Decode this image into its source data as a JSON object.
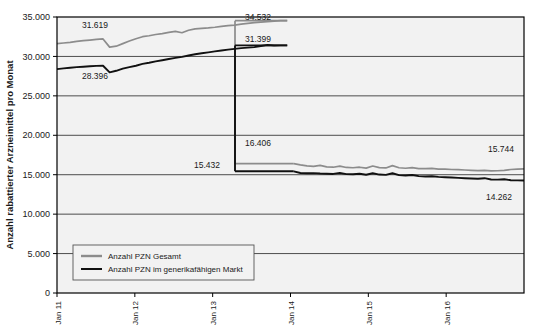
{
  "chart_data": {
    "type": "line",
    "title": "",
    "xlabel": "",
    "ylabel": "Anzahl rabattierter Arzneimittel pro Monat",
    "ylim": [
      0,
      35000
    ],
    "yticks": [
      "0",
      "5.000",
      "10.000",
      "15.000",
      "20.000",
      "25.000",
      "30.000",
      "35.000"
    ],
    "ytick_values": [
      0,
      5000,
      10000,
      15000,
      20000,
      25000,
      30000,
      35000
    ],
    "xticks": [
      "Jan 11",
      "Jan 12",
      "Jan 13",
      "Jan 14",
      "Jan 15",
      "Jan 16"
    ],
    "xtick_values": [
      0,
      12,
      24,
      36,
      48,
      60
    ],
    "xlim": [
      0,
      72
    ],
    "grid": "horizontal",
    "legend_position": "bottom-left",
    "series": [
      {
        "name": "Anzahl PZN Gesamt",
        "color": "#8c8c8c",
        "values": [
          31619,
          31700,
          31780,
          31900,
          32000,
          32080,
          32150,
          32220,
          31180,
          31300,
          31620,
          31950,
          32250,
          32500,
          32620,
          32780,
          32900,
          33050,
          33180,
          33000,
          33320,
          33500,
          33560,
          33620,
          33700,
          33820,
          33900,
          33980,
          34100,
          34200,
          34280,
          34350,
          34420,
          34480,
          34530,
          34532,
          16406,
          16250,
          16120,
          16050,
          16180,
          16000,
          15950,
          16080,
          15920,
          15880,
          15950,
          15840,
          16100,
          15900,
          15860,
          16150,
          15880,
          15820,
          15900,
          15780,
          15760,
          15800,
          15720,
          15700,
          15660,
          15640,
          15600,
          15560,
          15520,
          15560,
          15480,
          15500,
          15540,
          15660,
          15700,
          15744
        ]
      },
      {
        "name": "Anzahl PZN im generikafähigen Markt",
        "color": "#111111",
        "values": [
          28396,
          28480,
          28560,
          28640,
          28700,
          28760,
          28800,
          28820,
          27980,
          28180,
          28450,
          28640,
          28820,
          29050,
          29200,
          29380,
          29520,
          29680,
          29820,
          29950,
          30120,
          30280,
          30400,
          30520,
          30640,
          30760,
          30860,
          30960,
          31050,
          31120,
          31180,
          31320,
          31450,
          31380,
          31400,
          31399,
          15432,
          15220,
          15180,
          15200,
          15150,
          15120,
          15100,
          15220,
          15080,
          15050,
          15130,
          15000,
          15180,
          15020,
          14980,
          15180,
          14950,
          14900,
          14960,
          14820,
          14780,
          14800,
          14720,
          14680,
          14640,
          14600,
          14560,
          14520,
          14480,
          14560,
          14400,
          14380,
          14420,
          14300,
          14280,
          14262
        ]
      }
    ],
    "annotations": [
      {
        "text": "31.619",
        "value": 31619,
        "x_px": 82,
        "y_px": 28,
        "series": "Anzahl PZN Gesamt"
      },
      {
        "text": "28.396",
        "value": 28396,
        "x_px": 82,
        "y_px": 79,
        "series": "Anzahl PZN im generikafähigen Markt"
      },
      {
        "text": "34.532",
        "value": 34532,
        "x_px": 245,
        "y_px": 20,
        "series": "Anzahl PZN Gesamt"
      },
      {
        "text": "31.399",
        "value": 31399,
        "x_px": 245,
        "y_px": 42,
        "series": "Anzahl PZN im generikafähigen Markt"
      },
      {
        "text": "15.432",
        "value": 15432,
        "x_px": 194,
        "y_px": 168,
        "series": "Anzahl PZN im generikafähigen Markt"
      },
      {
        "text": "16.406",
        "value": 16406,
        "x_px": 245,
        "y_px": 146,
        "series": "Anzahl PZN Gesamt"
      },
      {
        "text": "15.744",
        "value": 15744,
        "x_px": 488,
        "y_px": 152,
        "series": "Anzahl PZN Gesamt"
      },
      {
        "text": "14.262",
        "value": 14262,
        "x_px": 486,
        "y_px": 200,
        "series": "Anzahl PZN im generikafähigen Markt"
      }
    ],
    "drop_event": {
      "x_px": 235,
      "description": "Sprung nach unten"
    },
    "colors": {
      "plot_background": "#f2f2f2",
      "gridline": "#4d4d4d",
      "border": "#000000",
      "series_gesamt": "#8c8c8c",
      "series_generika": "#111111"
    }
  },
  "legend": {
    "items": [
      {
        "label": "Anzahl PZN Gesamt",
        "color": "#8c8c8c"
      },
      {
        "label": "Anzahl PZN im generikafähigen Markt",
        "color": "#111111"
      }
    ]
  }
}
